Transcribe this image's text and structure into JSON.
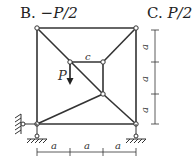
{
  "options": [
    {
      "letter": "B.",
      "value": "−P/2"
    },
    {
      "letter": "C.",
      "value": "P/2"
    }
  ],
  "diagram": {
    "load_label": "P",
    "bar_label": "c",
    "dimension_label": "a",
    "horizontal_dims": [
      "a",
      "a",
      "a"
    ],
    "vertical_dims": [
      "a",
      "a",
      "a"
    ]
  }
}
